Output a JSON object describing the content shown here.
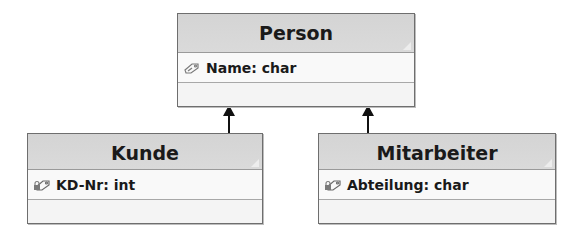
{
  "diagram": {
    "type": "uml-class-diagram",
    "classes": [
      {
        "id": "person",
        "name": "Person",
        "attributes": [
          {
            "icon": "public-attribute-icon",
            "label": "Name: char"
          }
        ],
        "operations": []
      },
      {
        "id": "kunde",
        "name": "Kunde",
        "attributes": [
          {
            "icon": "private-attribute-icon",
            "label": "KD-Nr: int"
          }
        ],
        "operations": []
      },
      {
        "id": "mitarbeiter",
        "name": "Mitarbeiter",
        "attributes": [
          {
            "icon": "private-attribute-icon",
            "label": "Abteilung: char"
          }
        ],
        "operations": []
      }
    ],
    "relationships": [
      {
        "type": "generalization",
        "from": "Kunde",
        "to": "Person"
      },
      {
        "type": "generalization",
        "from": "Mitarbeiter",
        "to": "Person"
      }
    ],
    "colors": {
      "header": "#d6d6d6",
      "body": "#f7f7f7",
      "border": "#6e6e6e",
      "arrow": "#111111"
    }
  }
}
